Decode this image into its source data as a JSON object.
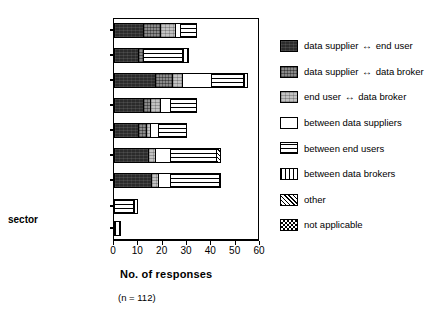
{
  "chart_data": {
    "type": "bar",
    "orientation": "horizontal",
    "stacked": true,
    "title": "",
    "xlabel": "No. of responses",
    "ylabel": "sector",
    "xlim": [
      0,
      60
    ],
    "ylim": null,
    "grid": false,
    "note": "(n = 112)",
    "legend_position": "right",
    "xticks": [
      "0",
      "10",
      "20",
      "30",
      "40",
      "50",
      "60"
    ],
    "xtick_values": [
      0,
      10,
      20,
      30,
      40,
      50,
      60
    ],
    "categories": [
      "GIS industry",
      "Private sector",
      "Local authorities",
      "Provincial government",
      "National government",
      "Academia",
      "Para-statals",
      "NGOs",
      "Other"
    ],
    "series": [
      {
        "name": "data supplier  end user",
        "key": "ds-eu",
        "values": [
          12,
          10,
          17,
          12,
          10,
          14,
          15,
          0,
          0
        ]
      },
      {
        "name": "data supplier  data broker",
        "key": "ds-db",
        "values": [
          7,
          2,
          7,
          3,
          3,
          0,
          0,
          0,
          0
        ]
      },
      {
        "name": "end user  data broker",
        "key": "eu-db",
        "values": [
          6,
          0,
          4,
          4,
          2,
          3,
          3,
          0,
          0
        ]
      },
      {
        "name": "between data suppliers",
        "key": "bds",
        "values": [
          2,
          0,
          12,
          4,
          3,
          6,
          5,
          0,
          0
        ]
      },
      {
        "name": "between end users",
        "key": "beu",
        "values": [
          7,
          16,
          13,
          11,
          12,
          19,
          20,
          8,
          0
        ]
      },
      {
        "name": "between data brokers",
        "key": "bdb",
        "values": [
          0,
          3,
          2,
          0,
          0,
          0,
          1,
          2,
          3
        ]
      },
      {
        "name": "other",
        "key": "other",
        "values": [
          0,
          0,
          0,
          0,
          0,
          2,
          0,
          0,
          0
        ]
      },
      {
        "name": "not applicable",
        "key": "na",
        "values": [
          0,
          0,
          0,
          0,
          0,
          0,
          0,
          0,
          0
        ]
      }
    ],
    "totals": [
      34,
      31,
      55,
      34,
      30,
      44,
      44,
      10,
      3
    ]
  },
  "legend": {
    "items": [
      {
        "swatch": "ds-eu",
        "left": "data supplier",
        "arrow": "↔",
        "right": "end user",
        "text": "data supplier ↔ end user"
      },
      {
        "swatch": "ds-db",
        "left": "data supplier",
        "arrow": "↔",
        "right": "data broker",
        "text": "data supplier ↔ data broker"
      },
      {
        "swatch": "eu-db",
        "left": "end user",
        "arrow": "↔",
        "right": "data broker",
        "text": "end user ↔ data broker"
      },
      {
        "swatch": "bds",
        "left": "",
        "arrow": "",
        "right": "",
        "text": "between data suppliers"
      },
      {
        "swatch": "beu",
        "left": "",
        "arrow": "",
        "right": "",
        "text": "between end users"
      },
      {
        "swatch": "bdb",
        "left": "",
        "arrow": "",
        "right": "",
        "text": "between data brokers"
      },
      {
        "swatch": "other",
        "left": "",
        "arrow": "",
        "right": "",
        "text": "other"
      },
      {
        "swatch": "na",
        "left": "",
        "arrow": "",
        "right": "",
        "text": "not applicable"
      }
    ]
  },
  "axes": {
    "x_title": "No. of responses",
    "y_title": "sector",
    "sample_note": "(n = 112)"
  }
}
